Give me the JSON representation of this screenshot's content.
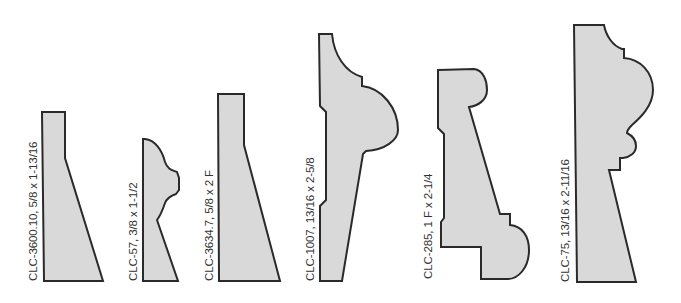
{
  "diagram": {
    "type": "molding-profiles",
    "background": "#ffffff",
    "fill_color": "#d9d9d9",
    "stroke_color": "#2a2a2a",
    "profiles": [
      {
        "id": "CLC-3600.10",
        "label": "CLC-3600.10,  5/8 x 1-13/16",
        "size": "5/8 x 1-13/16"
      },
      {
        "id": "CLC-57",
        "label": "CLC-57,  3/8 x 1-1/2",
        "size": "3/8 x 1-1/2"
      },
      {
        "id": "CLC-3634.7",
        "label": "CLC-3634.7, 5/8 x 2 F",
        "size": "5/8 x 2 F"
      },
      {
        "id": "CLC-1007",
        "label": "CLC-1007,  13/16 x 2-5/8",
        "size": "13/16 x 2-5/8"
      },
      {
        "id": "CLC-285",
        "label": "CLC-285,  1 F x 2-1/4",
        "size": "1 F x 2-1/4"
      },
      {
        "id": "CLC-75",
        "label": "CLC-75,  13/16 x 2-11/16",
        "size": "13/16 x 2-11/16"
      }
    ]
  }
}
